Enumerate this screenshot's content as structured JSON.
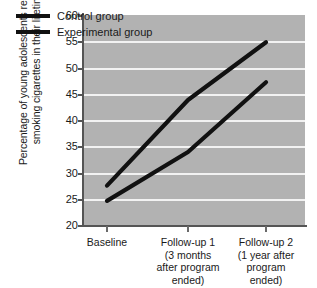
{
  "chart_data": {
    "type": "line",
    "title": "",
    "xlabel": "",
    "ylabel": "Percentage of young adolescents reporting smoking cigarettes in their lifetime",
    "ylabel_line1": "Percentage of young adolescents reporting",
    "ylabel_line2": "smoking cigarettes in their lifetime",
    "categories": [
      "Baseline",
      "Follow-up 1",
      "Follow-up 2"
    ],
    "category_sublabels": [
      [
        "Baseline"
      ],
      [
        "Follow-up 1",
        "(3 months",
        "after program",
        "ended)"
      ],
      [
        "Follow-up 2",
        "(1 year after",
        "program",
        "ended)"
      ]
    ],
    "series": [
      {
        "name": "Control group",
        "values": [
          27.5,
          43.8,
          54.8
        ],
        "color": "#111111"
      },
      {
        "name": "Experimental group",
        "values": [
          24.6,
          33.9,
          47.2
        ],
        "color": "#111111"
      }
    ],
    "ylim": [
      20,
      60
    ],
    "yticks": [
      20,
      25,
      30,
      35,
      40,
      45,
      50,
      55,
      60
    ],
    "ytick_labels": [
      "20",
      "25",
      "30",
      "35",
      "40",
      "45",
      "50",
      "55",
      "60"
    ],
    "grid": true,
    "grid_color": "#f2f2f2",
    "plot_background": "#b2b2b2",
    "page_background": "#ffffff",
    "legend_position": "top-left-inside",
    "legend": [
      "Control group",
      "Experimental group"
    ]
  }
}
